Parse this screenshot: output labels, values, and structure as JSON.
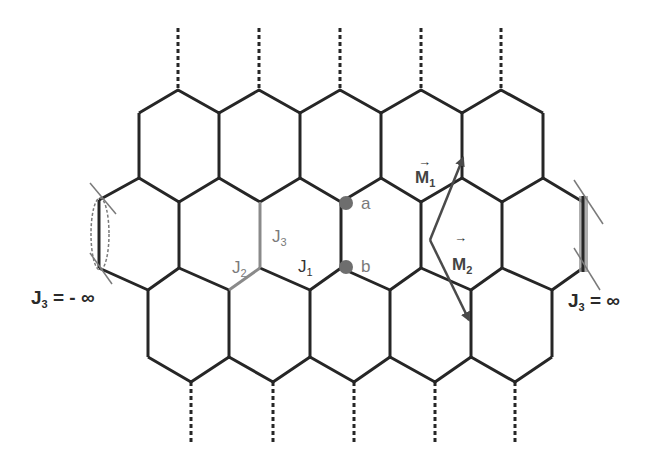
{
  "diagram": {
    "type": "honeycomb-lattice",
    "colors": {
      "bond": "#262626",
      "highlight_bond": "#8a8a8a",
      "site": "#6e6e6e",
      "arrow": "#4a4a4a",
      "edge_spin_right": "#8a8a8a"
    },
    "sites": {
      "a": {
        "label": "a",
        "x": 346,
        "y": 203
      },
      "b": {
        "label": "b",
        "x": 346,
        "y": 267
      }
    },
    "couplings": {
      "J1": {
        "base": "J",
        "sub": "1"
      },
      "J2": {
        "base": "J",
        "sub": "2"
      },
      "J3": {
        "base": "J",
        "sub": "3"
      }
    },
    "vectors": {
      "M1": {
        "base": "M",
        "sub": "1",
        "arrow": "→"
      },
      "M2": {
        "base": "M",
        "sub": "2",
        "arrow": "→"
      }
    },
    "edge_labels": {
      "left": {
        "base": "J",
        "sub": "3",
        "rest": "= - ∞"
      },
      "right": {
        "base": "J",
        "sub": "3",
        "rest": "= ∞"
      }
    }
  }
}
